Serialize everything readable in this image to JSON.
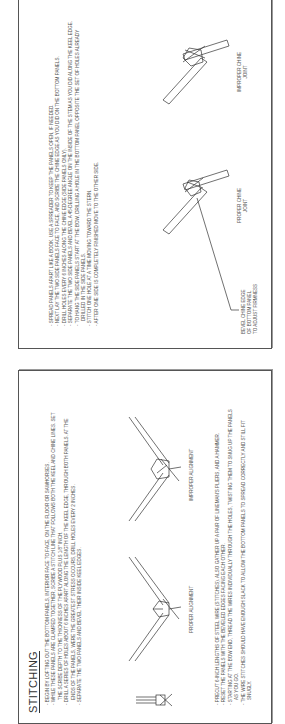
{
  "pages": [
    {
      "title": "STITCHING",
      "steps_top": [
        "Begin by lofting out the bottom panels, interior face to face, on the floor or sawhorses.",
        "While these panels are clamped together, scribe a stitch line that follows both the keel and chine lines. Set the scribe depth to the thickness of the plywood plus 1/8\" inch.",
        "Drill a series of holes about 6 inches apart along the length of the keel edge, through both panels.  At the ends of the panels, were the greatest stress occurs, drill holes every 2 inches.",
        "Separate the two panels and bevel their inside keel edges."
      ],
      "figure_labels": {
        "proper": "PROPER ALIGNMENT",
        "improper": "IMPROPER ALIGNMENT"
      },
      "steps_bottom": [
        "Precut 6-inch lengths of steel wire (stitches).  Also gather up a pair of lineman's pliers, and a hammer.",
        "Reset the panels with the beveled edges facing each other.",
        "Starting at the bow end, thread the wires individually through the holes, twisting them to snug up the panels as you go.",
        "The wire stitches should have enough slack to allow the bottom panels to spread correctly and still fit snugly."
      ]
    },
    {
      "steps": [
        "Spread panels apart like a book.  Use a spreader to keep the panels open, if needed.",
        "Next lay the two side panels face to face, and scribe the chine edge as you did on the bottom panels.",
        "Drill holes every 6 inches along the chine edge (side panels only).",
        "Separate the two side panels and bevel a 45-degree angle on the inside of the stem as you did along the keel edge.",
        "To hang the side panels start at the bow, drilling a hole in the bottom panel opposite the set of holes already drilled in the side panels.",
        "Stitch one hole at a time moving toward the stern.",
        "After one side is completely finished move to the other side."
      ],
      "figure_labels": {
        "bevel_note": [
          "BEVEL CHINE EDGE",
          "OF BOTTOM PANEL",
          "TO ADJUST FIRMNESS"
        ],
        "proper": [
          "PROPER CHINE",
          "JOINT"
        ],
        "improper": [
          "IMPROPER CHINE",
          "JOINT"
        ]
      }
    }
  ]
}
